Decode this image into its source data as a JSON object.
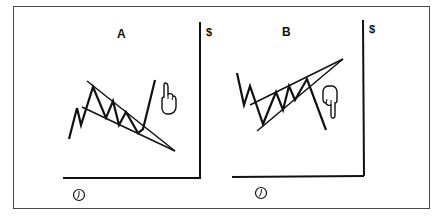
{
  "figure": {
    "panels": [
      {
        "id": "A",
        "label": "A",
        "y_axis_label": "$",
        "x_axis_icon": "clock-icon",
        "pattern": "falling-wedge",
        "breakout_direction": "up",
        "signal_icon": "hand-pointing-up-icon"
      },
      {
        "id": "B",
        "label": "B",
        "y_axis_label": "$",
        "x_axis_icon": "clock-icon",
        "pattern": "rising-wedge",
        "breakout_direction": "down",
        "signal_icon": "hand-pointing-down-icon"
      }
    ],
    "colors": {
      "ink": "#111111",
      "frame": "#4a4a4a",
      "background": "#ffffff"
    }
  }
}
